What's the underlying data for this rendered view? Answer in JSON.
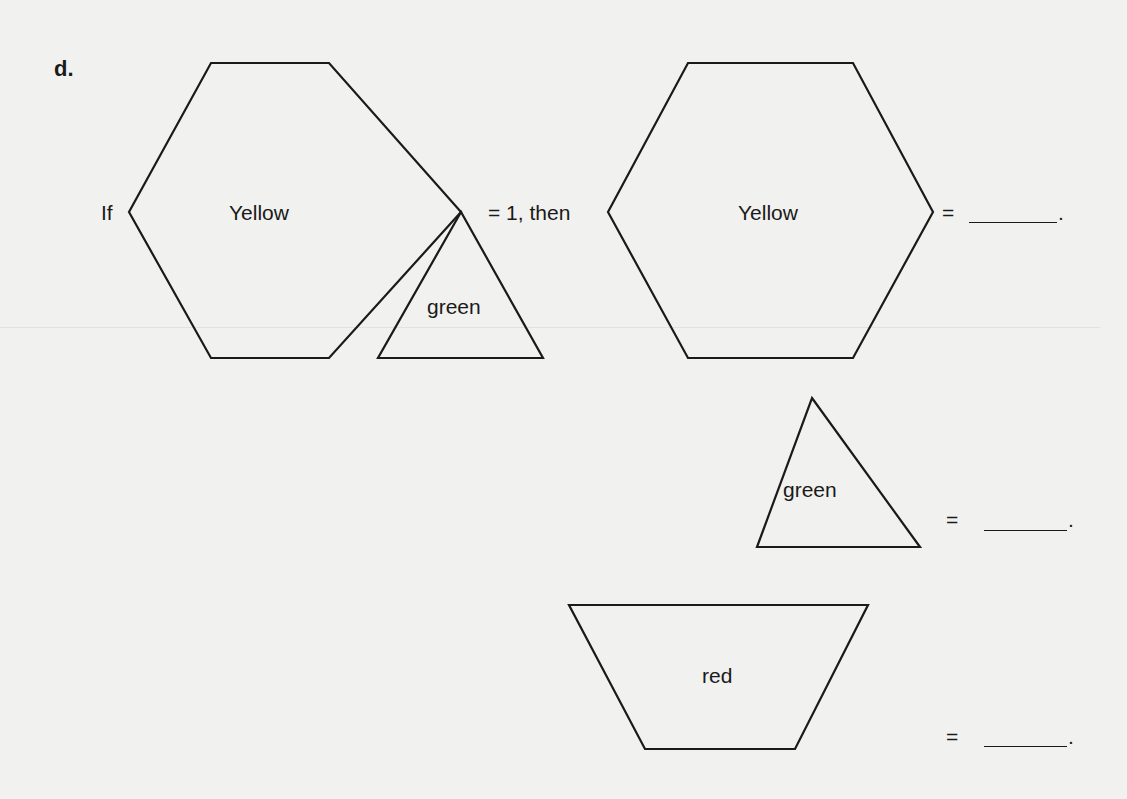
{
  "problem": {
    "label": "d.",
    "prefix": "If",
    "given_shape": {
      "type": "hexagon",
      "label": "Yellow",
      "attached_shape": {
        "type": "triangle",
        "label": "green"
      }
    },
    "given_text": "= 1, then",
    "questions": [
      {
        "shape": "hexagon",
        "label": "Yellow",
        "equals": "=",
        "answer": "",
        "period": "."
      },
      {
        "shape": "triangle",
        "label": "green",
        "equals": "=",
        "answer": "",
        "period": "."
      },
      {
        "shape": "trapezoid",
        "label": "red",
        "equals": "=",
        "answer": "",
        "period": "."
      }
    ]
  },
  "colors": {
    "stroke": "#1a1a1a",
    "paper": "#f1f1ef"
  }
}
